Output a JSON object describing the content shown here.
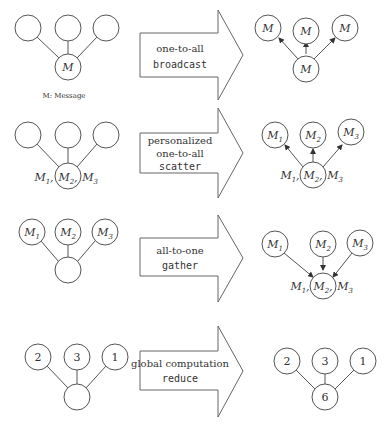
{
  "legend": {
    "caption": "M: Message"
  },
  "rows": [
    {
      "name": "broadcast",
      "operation": {
        "line1": "one-to-all",
        "line2": "",
        "keyword": "broadcast"
      },
      "before": {
        "top": [
          "",
          "",
          ""
        ],
        "bottom": "M",
        "bottom_sub": ""
      },
      "after": {
        "top": [
          "M",
          "M",
          "M"
        ],
        "bottom": "M"
      }
    },
    {
      "name": "scatter",
      "operation": {
        "line1": "personalized",
        "line2": "one-to-all",
        "keyword": "scatter"
      },
      "before": {
        "top": [
          "",
          "",
          ""
        ],
        "bottom_label": [
          "M1,",
          "M2,",
          "M3"
        ]
      },
      "after": {
        "top": [
          "M1",
          "M2",
          "M3"
        ],
        "bottom_label": [
          "M1,",
          "M2,",
          "M3"
        ]
      }
    },
    {
      "name": "gather",
      "operation": {
        "line1": "all-to-one",
        "line2": "",
        "keyword": "gather"
      },
      "before": {
        "top": [
          "M1",
          "M2",
          "M3"
        ],
        "bottom": ""
      },
      "after": {
        "top": [
          "M1",
          "M2",
          "M3"
        ],
        "bottom_label": [
          "M1,",
          "M2,",
          "M3"
        ]
      }
    },
    {
      "name": "reduce",
      "operation": {
        "line1": "global computation",
        "line2": "",
        "keyword": "reduce"
      },
      "before": {
        "top": [
          "2",
          "3",
          "1"
        ],
        "bottom": ""
      },
      "after": {
        "top": [
          "2",
          "3",
          "1"
        ],
        "bottom": "6"
      }
    }
  ]
}
